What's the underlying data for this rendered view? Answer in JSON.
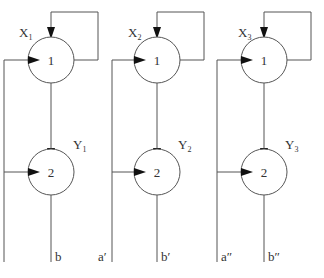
{
  "diagram": {
    "stroke_color": "#555555",
    "arrow_color": "#111111",
    "groups": [
      {
        "cx": 51,
        "left_x": 4,
        "top_label": "X",
        "top_sub": "1",
        "bottom_label": "Y",
        "bottom_sub": "1",
        "node_top": "1",
        "node_bottom": "2",
        "input_label": "",
        "output_label": "b"
      },
      {
        "cx": 157,
        "left_x": 112,
        "top_label": "X",
        "top_sub": "2",
        "bottom_label": "Y",
        "bottom_sub": "2",
        "node_top": "1",
        "node_bottom": "2",
        "input_label": "a′",
        "output_label": "b′"
      },
      {
        "cx": 264,
        "left_x": 217,
        "top_label": "X",
        "top_sub": "3",
        "bottom_label": "Y",
        "bottom_sub": "3",
        "node_top": "1",
        "node_bottom": "2",
        "input_label": "a″",
        "output_label": "b″"
      }
    ]
  }
}
